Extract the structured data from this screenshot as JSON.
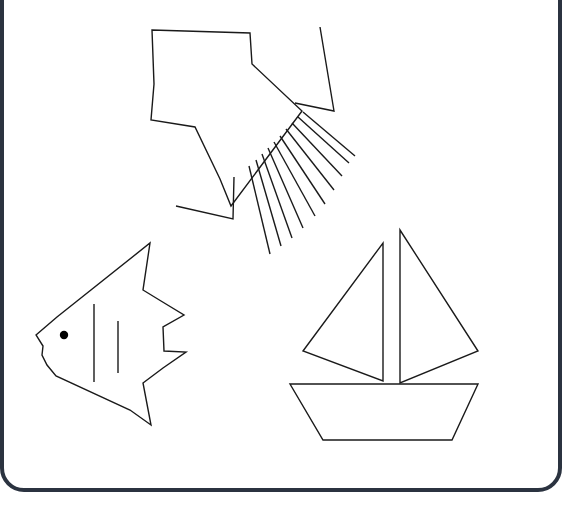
{
  "scene": {
    "title": "Sea-themed line drawing",
    "description": "Black outline drawing on white page with rounded dark border; a squid/jet shape with radiating lines at top, an angelfish at lower left, a sailboat at lower right.",
    "canvas": {
      "width": 575,
      "height": 518
    },
    "colors": {
      "background": "#ffffff",
      "stroke": "#1a1a1a",
      "border": "#2b3340",
      "eye_fill": "#000000"
    },
    "stroke_width": 1.4,
    "border_stroke_width": 4
  },
  "page_border": {
    "name": "page-border",
    "x": 2,
    "y": -60,
    "width": 558,
    "height": 550,
    "radius": 22
  },
  "objects": [
    {
      "id": "squid",
      "label": "squid-shape",
      "body_points": "152,30 250,33 252,64 302,111 231,206 220,179 195,127 151,120 154,84",
      "right_fin_points": "320,27 334,111 295,103",
      "left_fin_points": "176,206 233,219 234,177",
      "tentacles": [
        "303,112 355,156",
        "298,117 349,163",
        "292,123 342,176",
        "286,129 334,190",
        "280,136 325,204",
        "274,142 315,216",
        "268,148 303,228",
        "262,154 292,238",
        "256,160 281,246",
        "249,166 270,254"
      ]
    },
    {
      "id": "angelfish",
      "label": "angelfish-shape",
      "body_points": "36,335 57,317 150,243 143,290 161,301 184,315 163,327 164,351 186,352 163,368 143,383 151,425 130,410 56,376 47,365 42,355 43,346",
      "eye": {
        "cx": 64,
        "cy": 335,
        "r": 4.2
      },
      "stripes": [
        "94,304 94,382",
        "118,321 118,373"
      ]
    },
    {
      "id": "sailboat",
      "label": "sailboat-shape",
      "mainsail_points": "400,230 400,383 478,351",
      "jib_points": "383,243 383,381 303,351",
      "hull_points": "290,384 478,384 452,440 323,440"
    }
  ]
}
